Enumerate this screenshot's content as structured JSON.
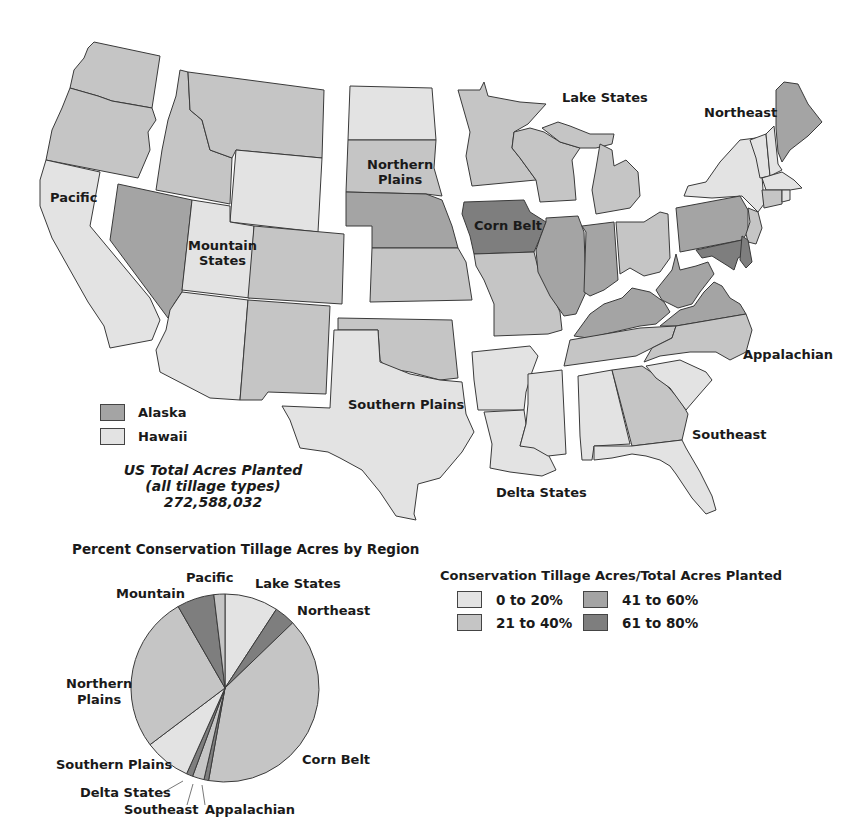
{
  "header": {
    "text": "AGRICULTURAL LANDS"
  },
  "colors": {
    "c0_20": "#e3e3e3",
    "c21_40": "#c5c5c5",
    "c41_60": "#a4a4a4",
    "c61_80": "#7e7e7e",
    "stroke": "#3a3a3a"
  },
  "map": {
    "region_labels": {
      "pacific": "Pacific",
      "mountain": "Mountain\nStates",
      "northern_plains": "Northern\nPlains",
      "lake_states": "Lake States",
      "corn_belt": "Corn Belt",
      "northeast": "Northeast",
      "appalachian": "Appalachian",
      "southern_plains": "Southern Plains",
      "delta_states": "Delta States",
      "southeast": "Southeast"
    },
    "insets": [
      {
        "label": "Alaska",
        "class": "41 to 60%"
      },
      {
        "label": "Hawaii",
        "class": "0 to 20%"
      }
    ],
    "total": {
      "line1": "US Total Acres Planted",
      "line2": "(all tillage types)",
      "value": "272,588,032"
    }
  },
  "legend": {
    "title": "Conservation Tillage Acres/Total Acres Planted",
    "items": [
      {
        "label": "0 to 20%"
      },
      {
        "label": "21 to 40%"
      },
      {
        "label": "41 to 60%"
      },
      {
        "label": "61 to 80%"
      }
    ]
  },
  "chart_data": {
    "type": "pie",
    "title": "Percent Conservation Tillage Acres by Region",
    "start_angle": "12 o'clock, clockwise",
    "categories": [
      "Lake States",
      "Northeast",
      "Corn Belt",
      "Appalachian",
      "Southeast",
      "Delta States",
      "Southern Plains",
      "Northern Plains",
      "Mountain",
      "Pacific"
    ],
    "values": [
      9.2,
      3.6,
      40.0,
      0.8,
      2.0,
      1.1,
      8.0,
      27.0,
      6.4,
      1.9
    ],
    "slice_fill_class": [
      "0 to 20%",
      "61 to 80%",
      "21 to 40%",
      "61 to 80%",
      "21 to 40%",
      "61 to 80%",
      "0 to 20%",
      "21 to 40%",
      "61 to 80%",
      "21 to 40%"
    ],
    "legend_position": "none (labels placed around pie)"
  }
}
